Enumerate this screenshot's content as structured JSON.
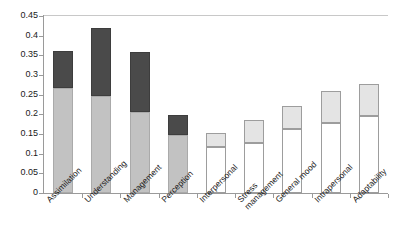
{
  "chart_data": {
    "type": "bar",
    "subtype": "stacked-bar",
    "title": "",
    "xlabel": "",
    "ylabel": "",
    "ylim": [
      0,
      0.45
    ],
    "ytick_step": 0.05,
    "grid": false,
    "legend": "none",
    "categories": [
      "Assimilation",
      "Understanding",
      "Management",
      "Perception",
      "Interpersonal",
      "Stress\nmanagement",
      "General mood",
      "Intrapersonal",
      "Adaptability"
    ],
    "ytick_labels": [
      "0",
      "0.05",
      "0.1",
      "0.15",
      "0.2",
      "0.25",
      "0.3",
      "0.35",
      "0.4",
      "0.45"
    ],
    "ytick_values": [
      0,
      0.05,
      0.1,
      0.15,
      0.2,
      0.25,
      0.3,
      0.35,
      0.4,
      0.45
    ],
    "series": [
      {
        "name": "lower-segment",
        "values": [
          0.268,
          0.246,
          0.207,
          0.148,
          0.118,
          0.127,
          0.162,
          0.178,
          0.195
        ]
      },
      {
        "name": "upper-segment",
        "values": [
          0.092,
          0.174,
          0.151,
          0.05,
          0.034,
          0.058,
          0.058,
          0.082,
          0.083
        ]
      }
    ],
    "totals": [
      0.36,
      0.42,
      0.358,
      0.198,
      0.152,
      0.185,
      0.22,
      0.26,
      0.278
    ],
    "bar_styles": [
      {
        "lower": "light",
        "upper": "dark"
      },
      {
        "lower": "light",
        "upper": "dark"
      },
      {
        "lower": "light",
        "upper": "dark"
      },
      {
        "lower": "light",
        "upper": "dark"
      },
      {
        "lower": "white",
        "upper": "pale"
      },
      {
        "lower": "white",
        "upper": "pale"
      },
      {
        "lower": "white",
        "upper": "pale"
      },
      {
        "lower": "white",
        "upper": "pale"
      },
      {
        "lower": "white",
        "upper": "pale"
      }
    ],
    "colors": {
      "dark": "#4a4a4a",
      "light": "#c2c2c2",
      "pale": "#e4e4e4",
      "white": "#ffffff",
      "axis": "#9a9a9a",
      "text": "#1a1a1a"
    }
  }
}
